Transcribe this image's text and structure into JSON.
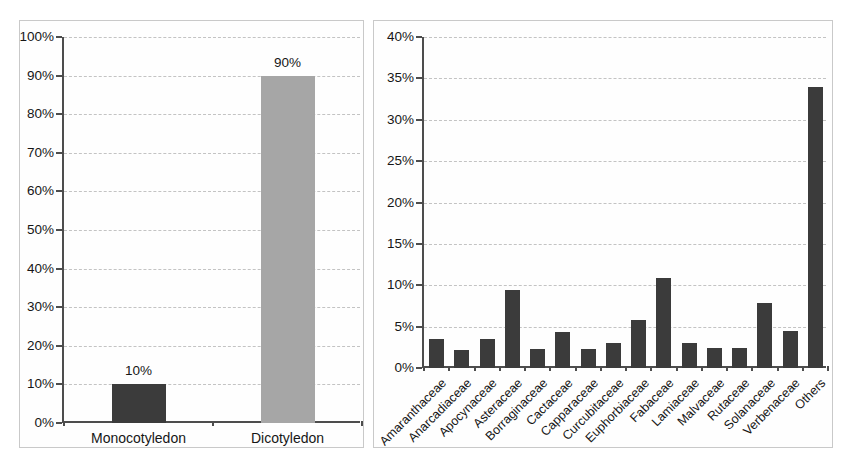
{
  "figure": {
    "background": "#ffffff",
    "panel_border_color": "#c9c9c9",
    "axis_color": "#4d4d4d",
    "gridline_color": "#c3c3c3",
    "text_color": "#161616"
  },
  "chart_data": [
    {
      "type": "bar",
      "title": "",
      "xlabel": "",
      "ylabel": "",
      "categories": [
        "Monocotyledon",
        "Dicotyledon"
      ],
      "values": [
        10,
        90
      ],
      "bar_value_labels": [
        "10%",
        "90%"
      ],
      "bar_colors": [
        "#3b3b3b",
        "#a6a6a6"
      ],
      "ylim": [
        0,
        100
      ],
      "y_tick_step": 10,
      "y_tick_labels": [
        "0%",
        "10%",
        "20%",
        "30%",
        "40%",
        "50%",
        "60%",
        "70%",
        "80%",
        "90%",
        "100%"
      ],
      "grid": true,
      "legend": false,
      "x_label_rotation": 0
    },
    {
      "type": "bar",
      "title": "",
      "xlabel": "",
      "ylabel": "",
      "categories": [
        "Amaranthaceae",
        "Anarcadiaceae",
        "Apocynaceae",
        "Asteraceae",
        "Borraginaceae",
        "Cactaceae",
        "Capparaceae",
        "Curcubitaceae",
        "Euphorbiaceae",
        "Fabaceae",
        "Lamiaceae",
        "Malvaceae",
        "Rutaceae",
        "Solanaceae",
        "Verbenaceae",
        "Others"
      ],
      "values": [
        3.5,
        2.2,
        3.5,
        9.4,
        2.3,
        4.3,
        2.3,
        3.0,
        5.8,
        10.9,
        3.0,
        2.4,
        2.4,
        7.9,
        4.5,
        34.0
      ],
      "bar_value_labels": [],
      "bar_colors": [
        "#3b3b3b"
      ],
      "ylim": [
        0,
        40
      ],
      "y_tick_step": 5,
      "y_tick_labels": [
        "0%",
        "5%",
        "10%",
        "15%",
        "20%",
        "25%",
        "30%",
        "35%",
        "40%"
      ],
      "grid": true,
      "legend": false,
      "x_label_rotation": -45
    }
  ]
}
